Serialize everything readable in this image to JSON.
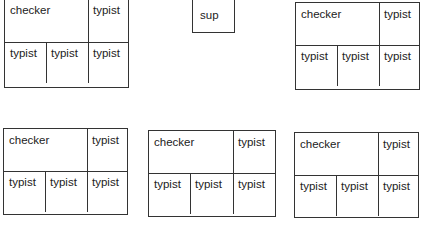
{
  "diagram": {
    "type": "org-structure",
    "supervisor": {
      "label": "sup"
    },
    "units": [
      {
        "id": 1,
        "checker": "checker",
        "typists": [
          "typist",
          "typist",
          "typist",
          "typist"
        ]
      },
      {
        "id": 2,
        "checker": "checker",
        "typists": [
          "typist",
          "typist",
          "typist",
          "typist"
        ]
      },
      {
        "id": 3,
        "checker": "checker",
        "typists": [
          "typist",
          "typist",
          "typist",
          "typist"
        ]
      },
      {
        "id": 4,
        "checker": "checker",
        "typists": [
          "typist",
          "typist",
          "typist",
          "typist"
        ]
      },
      {
        "id": 5,
        "checker": "checker",
        "typists": [
          "typist",
          "typist",
          "typist",
          "typist"
        ]
      }
    ]
  }
}
